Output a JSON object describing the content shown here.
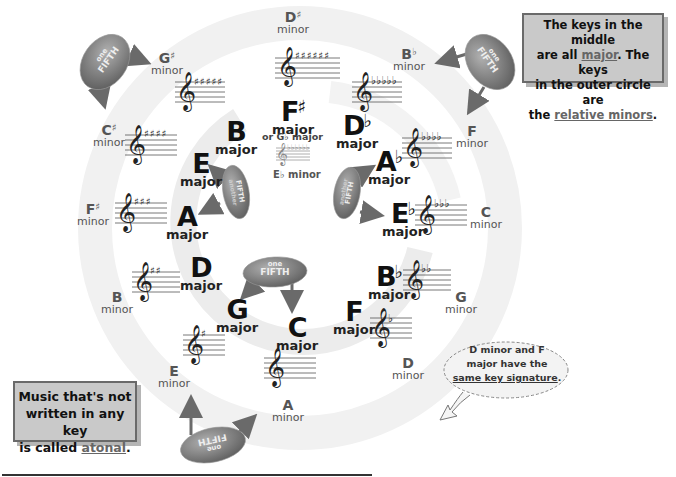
{
  "colors": {
    "background": "#ffffff",
    "ring": "#eeeeee",
    "note_box_fill": "#c9c9c9",
    "note_box_border": "#6a6a6a",
    "cloud_fill": "#8a8a8a",
    "text_major": "#111111",
    "text_minor": "#555555"
  },
  "majors": [
    {
      "id": "c",
      "letter": "C",
      "accidental": "",
      "mode": "major",
      "sharps": 0,
      "flats": 0
    },
    {
      "id": "g",
      "letter": "G",
      "accidental": "",
      "mode": "major",
      "sharps": 1,
      "flats": 0
    },
    {
      "id": "d",
      "letter": "D",
      "accidental": "",
      "mode": "major",
      "sharps": 2,
      "flats": 0
    },
    {
      "id": "a",
      "letter": "A",
      "accidental": "",
      "mode": "major",
      "sharps": 3,
      "flats": 0
    },
    {
      "id": "e",
      "letter": "E",
      "accidental": "",
      "mode": "major",
      "sharps": 4,
      "flats": 0
    },
    {
      "id": "b",
      "letter": "B",
      "accidental": "",
      "mode": "major",
      "sharps": 5,
      "flats": 0
    },
    {
      "id": "fsharp",
      "letter": "F",
      "accidental": "♯",
      "mode": "major",
      "sharps": 6,
      "flats": 0
    },
    {
      "id": "dflat",
      "letter": "D",
      "accidental": "♭",
      "mode": "major",
      "sharps": 0,
      "flats": 5
    },
    {
      "id": "aflat",
      "letter": "A",
      "accidental": "♭",
      "mode": "major",
      "sharps": 0,
      "flats": 4
    },
    {
      "id": "eflat",
      "letter": "E",
      "accidental": "♭",
      "mode": "major",
      "sharps": 0,
      "flats": 3
    },
    {
      "id": "bflat",
      "letter": "B",
      "accidental": "♭",
      "mode": "major",
      "sharps": 0,
      "flats": 2
    },
    {
      "id": "f",
      "letter": "F",
      "accidental": "",
      "mode": "major",
      "sharps": 0,
      "flats": 1
    }
  ],
  "minors": [
    {
      "id": "a",
      "letter": "A",
      "accidental": "",
      "mode": "minor"
    },
    {
      "id": "e",
      "letter": "E",
      "accidental": "",
      "mode": "minor"
    },
    {
      "id": "b",
      "letter": "B",
      "accidental": "",
      "mode": "minor"
    },
    {
      "id": "fsharp",
      "letter": "F",
      "accidental": "♯",
      "mode": "minor"
    },
    {
      "id": "csharp",
      "letter": "C",
      "accidental": "♯",
      "mode": "minor"
    },
    {
      "id": "gsharp",
      "letter": "G",
      "accidental": "♯",
      "mode": "minor"
    },
    {
      "id": "dsharp",
      "letter": "D",
      "accidental": "♯",
      "mode": "minor"
    },
    {
      "id": "bflat",
      "letter": "B",
      "accidental": "♭",
      "mode": "minor"
    },
    {
      "id": "f",
      "letter": "F",
      "accidental": "",
      "mode": "minor"
    },
    {
      "id": "c",
      "letter": "C",
      "accidental": "",
      "mode": "minor"
    },
    {
      "id": "g",
      "letter": "G",
      "accidental": "",
      "mode": "minor"
    },
    {
      "id": "d",
      "letter": "D",
      "accidental": "",
      "mode": "minor"
    }
  ],
  "enharmonic": {
    "or_label": "or G♭ major",
    "minor_label": "E♭ minor"
  },
  "clouds": [
    {
      "line1": "one",
      "line2": "FIFTH"
    },
    {
      "line1": "one",
      "line2": "FIFTH"
    },
    {
      "line1": "another",
      "line2": "FIFTH"
    },
    {
      "line1": "another",
      "line2": "FIFTH"
    },
    {
      "line1": "one",
      "line2": "FIFTH"
    },
    {
      "line1": "one",
      "line2": "FIFTH"
    }
  ],
  "notes": {
    "top_right": {
      "line1": "The keys in the middle",
      "line2_pre": "are all ",
      "line2_link": "major",
      "line2_post": ".  The keys",
      "line3": "in the outer circle are",
      "line4_pre": "the ",
      "line4_link": "relative minors",
      "line4_post": "."
    },
    "bottom_left": {
      "line1": "Music that's not",
      "line2": "written in any key",
      "line3_pre": "is called ",
      "line3_link": "atonal",
      "line3_post": "."
    },
    "bubble": {
      "line1": "D minor and F",
      "line2": "major have the",
      "line3_link": "same key signature",
      "line3_post": "."
    }
  }
}
